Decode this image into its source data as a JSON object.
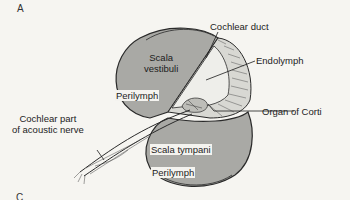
{
  "figure": {
    "panel_label": "A",
    "next_panel_label_partial": "C"
  },
  "labels": {
    "scala_vestibuli_line1": "Scala",
    "scala_vestibuli_line2": "vestibuli",
    "perilymph_upper": "Perilymph",
    "cochlear_duct": "Cochlear duct",
    "endolymph": "Endolymph",
    "organ_of_corti": "Organ of Corti",
    "nerve_line1": "Cochlear part",
    "nerve_line2": "of acoustic nerve",
    "scala_tympani": "Scala tympani",
    "perilymph_lower": "Perilymph"
  },
  "colors": {
    "background": "#f6f5f1",
    "chamber_fill": "#a9a9a5",
    "duct_fill": "#ededea",
    "outline": "#2a2a2a",
    "text": "#1c1c1c"
  }
}
